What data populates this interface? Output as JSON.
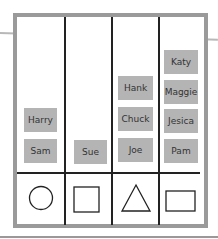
{
  "columns": [
    {
      "shape": "circle",
      "names": [
        "Harry",
        "Sam"
      ]
    },
    {
      "shape": "square",
      "names": [
        "Sue"
      ]
    },
    {
      "shape": "triangle",
      "names": [
        "Hank",
        "Chuck",
        "Joe"
      ]
    },
    {
      "shape": "rectangle",
      "names": [
        "Katy",
        "Maggie",
        "Jesica",
        "Pam"
      ]
    }
  ],
  "colors": {
    "frame": "#9a9a9a",
    "card": "#b4b4b4",
    "lines": "#222222"
  }
}
